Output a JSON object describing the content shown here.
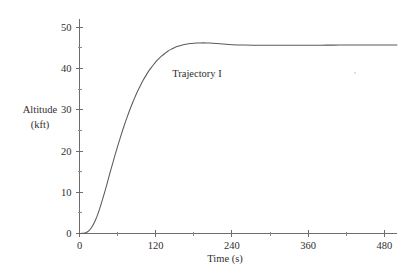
{
  "chart_data": {
    "type": "line",
    "title": "",
    "subtitle": "",
    "xlabel": "Time (s)",
    "ylabel": "Altitude\n(kft)",
    "ylabel_line1": "Altitude",
    "ylabel_line2": "(kft)",
    "xlim": [
      0,
      500
    ],
    "ylim": [
      0,
      52
    ],
    "grid": false,
    "legend": "none",
    "x_ticks_major": [
      0,
      120,
      240,
      360,
      480
    ],
    "x_ticklabels": [
      "0",
      "120",
      "240",
      "360",
      "480"
    ],
    "x_ticks_minor": [
      60,
      180,
      300,
      420
    ],
    "y_ticks_major": [
      0,
      10,
      20,
      30,
      40,
      50
    ],
    "y_ticklabels": [
      "0",
      "10",
      "20",
      "30",
      "40",
      "50"
    ],
    "y_ticks_minor": [
      5,
      15,
      25,
      35,
      45
    ],
    "annotations": [
      {
        "text": "Trajectory I",
        "x": 185,
        "y": 38.0
      }
    ],
    "series": [
      {
        "name": "Trajectory I",
        "color": "#5a5a5a",
        "x": [
          0,
          5,
          10,
          15,
          20,
          25,
          30,
          35,
          40,
          45,
          50,
          55,
          60,
          65,
          70,
          75,
          80,
          85,
          90,
          95,
          100,
          105,
          110,
          115,
          120,
          125,
          130,
          135,
          140,
          145,
          150,
          155,
          160,
          165,
          170,
          175,
          180,
          185,
          190,
          195,
          200,
          205,
          210,
          215,
          220,
          230,
          240,
          250,
          260,
          280,
          300,
          320,
          340,
          360,
          380,
          400,
          420,
          440,
          460,
          480,
          500
        ],
        "y": [
          0.0,
          0.05,
          0.2,
          0.7,
          1.7,
          3.2,
          5.2,
          7.6,
          10.2,
          13.0,
          15.8,
          18.5,
          21.1,
          23.6,
          26.0,
          28.2,
          30.3,
          32.2,
          34.0,
          35.6,
          37.1,
          38.4,
          39.6,
          40.6,
          41.6,
          42.4,
          43.1,
          43.7,
          44.3,
          44.7,
          45.1,
          45.4,
          45.6,
          45.8,
          45.95,
          46.05,
          46.12,
          46.17,
          46.2,
          46.21,
          46.2,
          46.18,
          46.14,
          46.08,
          46.0,
          45.88,
          45.78,
          45.72,
          45.68,
          45.64,
          45.63,
          45.63,
          45.64,
          45.65,
          45.66,
          45.67,
          45.68,
          45.69,
          45.7,
          45.71,
          45.72
        ]
      }
    ]
  },
  "figure": {
    "background_color": "#ffffff",
    "axis_color": "#6d6d6d",
    "text_color": "#2f2f2f",
    "line_color": "#5a5a5a"
  }
}
